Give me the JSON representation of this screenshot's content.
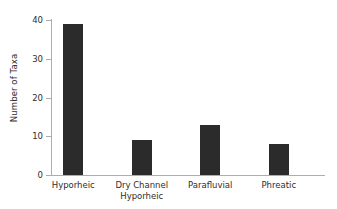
{
  "chart_data": {
    "type": "bar",
    "title": "",
    "xlabel": "",
    "ylabel": "Number of Taxa",
    "categories": [
      "Hyporheic",
      "Dry Channel\nHyporheic",
      "Parafluvial",
      "Phreatic"
    ],
    "values": [
      39,
      9,
      13,
      8
    ],
    "ylim": [
      0,
      40
    ],
    "yticks": [
      0,
      10,
      20,
      30,
      40
    ],
    "ytick_labels": [
      "0",
      "10",
      "20",
      "30",
      "40"
    ],
    "grid": false,
    "legend": false,
    "bar_color": "#2b2b2b",
    "axis_color": "#adadad",
    "text_color": "#2e2e2e",
    "background": "#ffffff"
  }
}
